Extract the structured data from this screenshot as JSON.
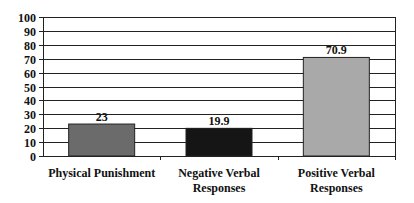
{
  "chart_data": {
    "type": "bar",
    "title": "",
    "xlabel": "",
    "ylabel": "",
    "categories": [
      "Physical Punishment",
      "Negative Verbal Responses",
      "Positive Verbal Responses"
    ],
    "category_lines": [
      [
        "Physical Punishment"
      ],
      [
        "Negative Verbal",
        "Responses"
      ],
      [
        "Positive Verbal",
        "Responses"
      ]
    ],
    "values": [
      23,
      19.9,
      70.9
    ],
    "value_labels": [
      "23",
      "19.9",
      "70.9"
    ],
    "bar_colors": [
      "#6b6b6b",
      "#151515",
      "#a9a9a9"
    ],
    "ylim": [
      0,
      100
    ],
    "yticks": [
      0,
      10,
      20,
      30,
      40,
      50,
      60,
      70,
      80,
      90,
      100
    ],
    "grid": true,
    "legend": null
  }
}
